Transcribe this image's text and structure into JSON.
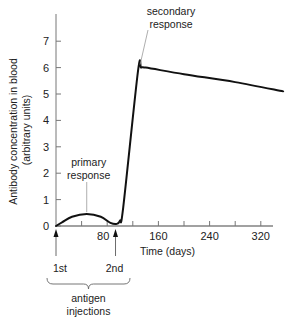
{
  "chart_data": {
    "type": "line",
    "title": "",
    "xlabel": "Time (days)",
    "ylabel_line1": "Antibody concentration in blood",
    "ylabel_line2": "(arbitrary units)",
    "xlim": [
      0,
      360
    ],
    "ylim": [
      0,
      8
    ],
    "x_ticks": [
      40,
      80,
      120,
      160,
      200,
      240,
      280,
      320
    ],
    "x_tick_labels": [
      {
        "value": 80,
        "label": "80"
      },
      {
        "value": 160,
        "label": "160"
      },
      {
        "value": 240,
        "label": "240"
      },
      {
        "value": 320,
        "label": "320"
      }
    ],
    "y_ticks": [
      0,
      1,
      2,
      3,
      4,
      5,
      6,
      7
    ],
    "y_tick_labels": [
      "0",
      "1",
      "2",
      "3",
      "4",
      "5",
      "6",
      "7"
    ],
    "grid": false,
    "series": [
      {
        "name": "Antibody concentration",
        "x": [
          0,
          10,
          25,
          48,
          70,
          85,
          95,
          100,
          105,
          128,
          133,
          140,
          200,
          280,
          355
        ],
        "y": [
          0,
          0.15,
          0.35,
          0.45,
          0.35,
          0.12,
          0.08,
          0.2,
          0.7,
          5.85,
          6.0,
          6.0,
          5.75,
          5.45,
          5.1
        ]
      }
    ],
    "annotations": [
      {
        "label_lines": [
          "primary",
          "response"
        ],
        "x": 48,
        "y": 0.45
      },
      {
        "label_lines": [
          "secondary",
          "response"
        ],
        "x": 133,
        "y": 6.0
      }
    ],
    "injections": [
      {
        "label": "1st",
        "x": 0
      },
      {
        "label": "2nd",
        "x": 93
      }
    ],
    "injection_group_label_lines": [
      "antigen",
      "injections"
    ],
    "color": "#111111"
  }
}
